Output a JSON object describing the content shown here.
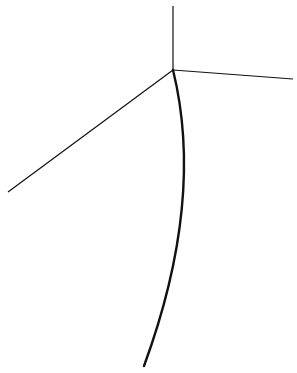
{
  "diagram": {
    "background": "#ffffff",
    "stroke_color": "#111111",
    "vertex": {
      "x": 173,
      "y": 70
    },
    "lines": [
      {
        "name": "up",
        "x2": 173,
        "y2": 6,
        "width": 1.2
      },
      {
        "name": "right",
        "x2": 293,
        "y2": 79,
        "width": 1.2
      },
      {
        "name": "left",
        "x2": 8,
        "y2": 192,
        "width": 1.2
      }
    ],
    "curve": {
      "path": "M173 70 Q205 200 144 366",
      "width": 2.4
    }
  }
}
